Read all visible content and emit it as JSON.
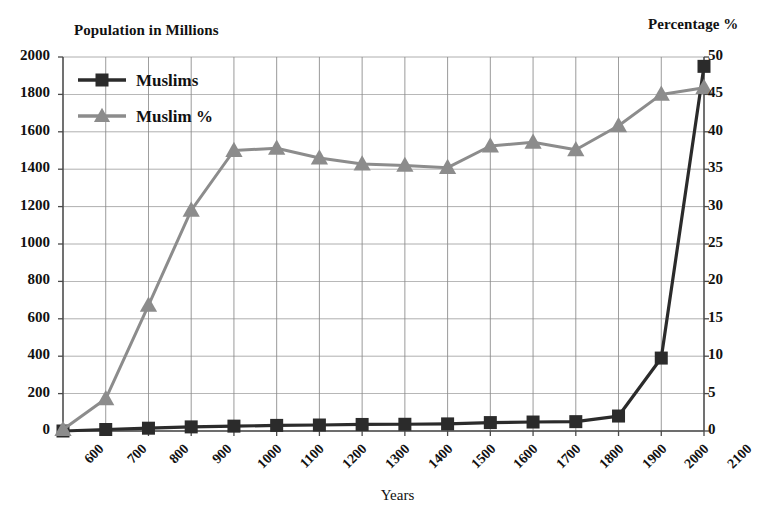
{
  "chart_data": {
    "type": "line",
    "title": "",
    "xlabel": "Years",
    "left_axis_label": "Population in Millions",
    "right_axis_label": "Percentage %",
    "grid": true,
    "legend_position": "top-left",
    "categories": [
      "600",
      "700",
      "800",
      "900",
      "1000",
      "1100",
      "1200",
      "1300",
      "1400",
      "1500",
      "1600",
      "1700",
      "1800",
      "1900",
      "2000",
      "2100"
    ],
    "left_ylim": [
      0,
      2000
    ],
    "left_yticks": [
      "0",
      "200",
      "400",
      "600",
      "800",
      "1000",
      "1200",
      "1400",
      "1600",
      "1800",
      "2000"
    ],
    "right_ylim": [
      0,
      50
    ],
    "right_yticks": [
      "0",
      "5",
      "10",
      "15",
      "20",
      "25",
      "30",
      "35",
      "40",
      "45",
      "50"
    ],
    "series": [
      {
        "name": "Muslims",
        "axis": "left",
        "unit": "millions",
        "marker": "square",
        "color": "#2b2b2b",
        "values": [
          0,
          8,
          15,
          22,
          26,
          30,
          32,
          35,
          36,
          38,
          45,
          48,
          50,
          80,
          390,
          1950
        ]
      },
      {
        "name": "Muslim %",
        "axis": "right",
        "unit": "percent",
        "marker": "triangle",
        "color": "#8c8c8c",
        "values": [
          0.2,
          4.3,
          16.8,
          29.5,
          37.5,
          37.8,
          36.5,
          35.7,
          35.5,
          35.2,
          38.1,
          38.6,
          37.6,
          40.8,
          45.0,
          45.9
        ]
      }
    ],
    "legend": [
      {
        "label": "Muslims",
        "marker": "square",
        "color": "#2b2b2b"
      },
      {
        "label": "Muslim %",
        "marker": "triangle",
        "color": "#8c8c8c"
      }
    ]
  },
  "colors": {
    "muslims_line": "#2b2b2b",
    "percent_line": "#8c8c8c",
    "grid": "#8a8a8a",
    "axis": "#555555",
    "background": "#ffffff"
  }
}
